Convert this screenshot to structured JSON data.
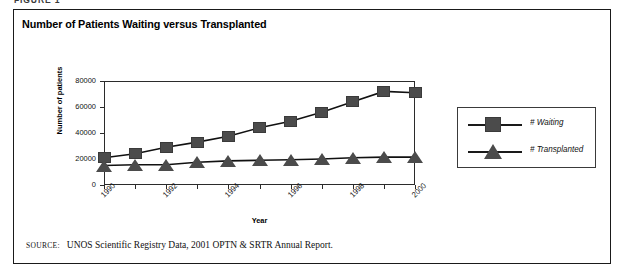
{
  "figure": {
    "label": "FIGURE 1"
  },
  "chart_data": {
    "type": "line",
    "title": "Number of Patients Waiting versus Transplanted",
    "xlabel": "Year",
    "ylabel": "Number of patients",
    "x": [
      1990,
      1991,
      1992,
      1993,
      1994,
      1995,
      1996,
      1997,
      1998,
      1999,
      2000
    ],
    "categories": [
      "1990",
      "1991",
      "1992",
      "1993",
      "1994",
      "1995",
      "1996",
      "1997",
      "1998",
      "1999",
      "2000"
    ],
    "xtick_labels": [
      "1990",
      "",
      "1992",
      "",
      "1994",
      "",
      "1996",
      "",
      "1998",
      "",
      "2000"
    ],
    "ytick_labels": [
      "0",
      "20000",
      "40000",
      "60000",
      "80000"
    ],
    "yticks": [
      0,
      20000,
      40000,
      60000,
      80000
    ],
    "ylim": [
      0,
      80000
    ],
    "xlim": [
      1990,
      2000
    ],
    "grid": true,
    "legend_position": "right-outside",
    "series": [
      {
        "name": "# Waiting",
        "marker": "square",
        "color": "#4b4b4b",
        "values": [
          21000,
          24000,
          29000,
          33000,
          37500,
          44000,
          49000,
          56000,
          64000,
          72000,
          71000
        ]
      },
      {
        "name": "# Transplanted",
        "marker": "triangle",
        "color": "#4b4b4b",
        "values": [
          15000,
          15500,
          15500,
          17500,
          18500,
          19000,
          19500,
          20000,
          21000,
          21500,
          21500
        ]
      }
    ]
  },
  "legend": {
    "items": [
      {
        "label": "# Waiting",
        "marker": "square"
      },
      {
        "label": "# Transplanted",
        "marker": "triangle"
      }
    ]
  },
  "source": {
    "kicker": "Source:",
    "text": "UNOS Scientific Registry Data, 2001 OPTN & SRTR Annual Report."
  }
}
